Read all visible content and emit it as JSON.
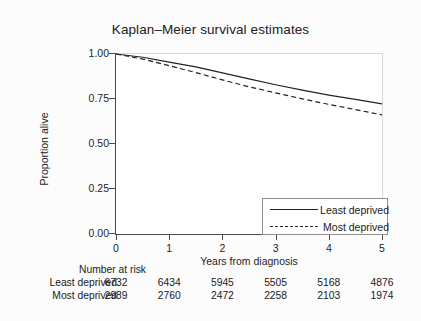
{
  "chart_data": {
    "type": "line",
    "title": "Kaplan–Meier survival estimates",
    "xlabel": "Years from diagnosis",
    "ylabel": "Proportion alive",
    "xlim": [
      0,
      5
    ],
    "ylim": [
      0,
      1
    ],
    "grid": false,
    "legend_position": "lower right",
    "x_ticks": [
      "0",
      "1",
      "2",
      "3",
      "4",
      "5"
    ],
    "y_ticks": [
      "0.00",
      "0.25",
      "0.50",
      "0.75",
      "1.00"
    ],
    "x": [
      0,
      0.5,
      1,
      1.5,
      2,
      2.5,
      3,
      3.5,
      4,
      4.5,
      5
    ],
    "series": [
      {
        "name": "Least deprived",
        "style": "solid",
        "color": "#222222",
        "values": [
          1.0,
          0.982,
          0.955,
          0.928,
          0.895,
          0.862,
          0.829,
          0.799,
          0.772,
          0.748,
          0.723
        ]
      },
      {
        "name": "Most deprived",
        "style": "dashed",
        "color": "#222222",
        "values": [
          1.0,
          0.972,
          0.935,
          0.897,
          0.856,
          0.818,
          0.784,
          0.751,
          0.72,
          0.691,
          0.662
        ]
      }
    ]
  },
  "legend": {
    "entries": [
      {
        "label": "Least deprived",
        "style": "solid"
      },
      {
        "label": "Most deprived",
        "style": "dashed"
      }
    ]
  },
  "risk_table": {
    "heading": "Number at risk",
    "columns": [
      "0",
      "1",
      "2",
      "3",
      "4",
      "5"
    ],
    "rows": [
      {
        "label": "Least deprived",
        "values": [
          "6732",
          "6434",
          "5945",
          "5505",
          "5168",
          "4876"
        ]
      },
      {
        "label": "Most deprived",
        "values": [
          "2989",
          "2760",
          "2472",
          "2258",
          "2103",
          "1974"
        ]
      }
    ]
  }
}
